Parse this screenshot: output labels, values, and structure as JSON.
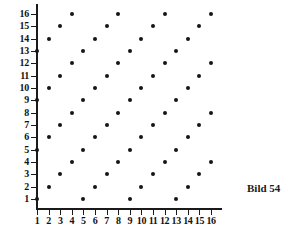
{
  "caption": "Bild 54",
  "chart_data": {
    "type": "scatter",
    "title": "",
    "subtitle": "",
    "xlabel": "",
    "ylabel": "",
    "xlim": [
      0,
      17
    ],
    "ylim": [
      0,
      17
    ],
    "grid": false,
    "legend": null,
    "x_ticks": [
      1,
      2,
      3,
      4,
      5,
      6,
      7,
      8,
      9,
      10,
      11,
      12,
      13,
      14,
      15,
      16
    ],
    "y_ticks": [
      1,
      2,
      3,
      4,
      5,
      6,
      7,
      8,
      9,
      10,
      11,
      12,
      13,
      14,
      15,
      16
    ],
    "x_tick_labels": [
      "1",
      "2",
      "3",
      "4",
      "5",
      "6",
      "7",
      "8",
      "9",
      "10",
      "11",
      "12",
      "13",
      "14",
      "15",
      "16"
    ],
    "y_tick_labels": [
      "1",
      "2",
      "3",
      "4",
      "5",
      "6",
      "7",
      "8",
      "9",
      "10",
      "11",
      "12",
      "13",
      "14",
      "15",
      "16"
    ],
    "marker": "circle",
    "marker_color": "#151515",
    "rule": "point plotted where (x - y) mod 4 == 0",
    "points": [
      [
        1,
        1
      ],
      [
        5,
        1
      ],
      [
        9,
        1
      ],
      [
        13,
        1
      ],
      [
        2,
        2
      ],
      [
        6,
        2
      ],
      [
        10,
        2
      ],
      [
        14,
        2
      ],
      [
        3,
        3
      ],
      [
        7,
        3
      ],
      [
        11,
        3
      ],
      [
        15,
        3
      ],
      [
        4,
        4
      ],
      [
        8,
        4
      ],
      [
        12,
        4
      ],
      [
        16,
        4
      ],
      [
        1,
        5
      ],
      [
        5,
        5
      ],
      [
        9,
        5
      ],
      [
        13,
        5
      ],
      [
        2,
        6
      ],
      [
        6,
        6
      ],
      [
        10,
        6
      ],
      [
        14,
        6
      ],
      [
        3,
        7
      ],
      [
        7,
        7
      ],
      [
        11,
        7
      ],
      [
        15,
        7
      ],
      [
        4,
        8
      ],
      [
        8,
        8
      ],
      [
        12,
        8
      ],
      [
        16,
        8
      ],
      [
        1,
        9
      ],
      [
        5,
        9
      ],
      [
        9,
        9
      ],
      [
        13,
        9
      ],
      [
        2,
        10
      ],
      [
        6,
        10
      ],
      [
        10,
        10
      ],
      [
        14,
        10
      ],
      [
        3,
        11
      ],
      [
        7,
        11
      ],
      [
        11,
        11
      ],
      [
        15,
        11
      ],
      [
        4,
        12
      ],
      [
        8,
        12
      ],
      [
        12,
        12
      ],
      [
        16,
        12
      ],
      [
        1,
        13
      ],
      [
        5,
        13
      ],
      [
        9,
        13
      ],
      [
        13,
        13
      ],
      [
        2,
        14
      ],
      [
        6,
        14
      ],
      [
        10,
        14
      ],
      [
        14,
        14
      ],
      [
        3,
        15
      ],
      [
        7,
        15
      ],
      [
        11,
        15
      ],
      [
        15,
        15
      ],
      [
        4,
        16
      ],
      [
        8,
        16
      ],
      [
        12,
        16
      ],
      [
        16,
        16
      ]
    ]
  }
}
